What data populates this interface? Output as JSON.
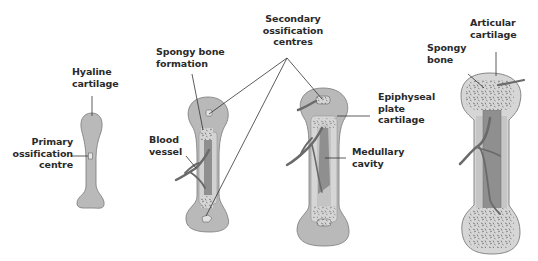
{
  "colors": {
    "cartilage": "#b9b9b9",
    "bone_collar": "#cfcfcf",
    "medullary": "#8f8f8f",
    "blood_vessel": "#6a6a6a",
    "outline": "#7a7a7a",
    "label_text": "#2a2a2a",
    "leader_line": "#333333"
  },
  "stages": [
    {
      "id": "stage-1",
      "labels": [
        {
          "name": "hyaline-cartilage-label",
          "text": "Hyaline\ncartilage"
        },
        {
          "name": "primary-ossification-centre-label",
          "text": "Primary\nossification\ncentre"
        }
      ]
    },
    {
      "id": "stage-2",
      "labels": [
        {
          "name": "spongy-bone-formation-label",
          "text": "Spongy bone\nformation"
        },
        {
          "name": "blood-vessel-label",
          "text": "Blood\nvessel"
        }
      ]
    },
    {
      "id": "stage-3",
      "labels": [
        {
          "name": "secondary-ossification-centres-label",
          "text": "Secondary\nossification\ncentres"
        },
        {
          "name": "epiphyseal-plate-cartilage-label",
          "text": "Epiphyseal\nplate\ncartilage"
        },
        {
          "name": "medullary-cavity-label",
          "text": "Medullary\ncavity"
        }
      ]
    },
    {
      "id": "stage-4",
      "labels": [
        {
          "name": "spongy-bone-label",
          "text": "Spongy\nbone"
        },
        {
          "name": "articular-cartilage-label",
          "text": "Articular\ncartilage"
        }
      ]
    }
  ]
}
